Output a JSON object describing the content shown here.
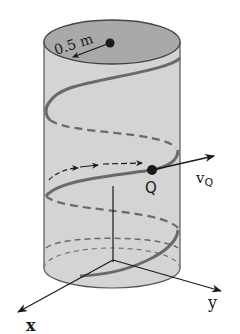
{
  "figure": {
    "labels": {
      "radius": "0.5 m",
      "point": "Q",
      "velocity_main": "v",
      "velocity_sub": "Q",
      "x_axis": "x",
      "y_axis": "y"
    },
    "colors": {
      "cylinder_body": "#d4d4d4",
      "cylinder_top": "#a9a9a9",
      "helix": "#6a6a6a",
      "outline": "#555555",
      "ink": "#1a1a1a"
    }
  }
}
